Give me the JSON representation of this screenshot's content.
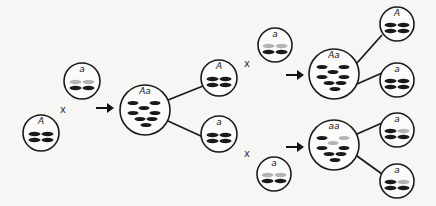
{
  "colors": {
    "dark_chromosome": "#1a1a1a",
    "light_chromosome": "#b4b4b4",
    "outline": "#1a1a1a",
    "background": "#f6f6f4"
  },
  "cells": [
    {
      "id": "parent-A-left",
      "label": "A",
      "cx": 41,
      "cy": 133,
      "r": 18,
      "type": "haploid",
      "rows": [
        [
          "dark",
          "dark"
        ],
        [
          "dark",
          "dark"
        ]
      ]
    },
    {
      "id": "parent-a-left",
      "label": "a",
      "cx": 82,
      "cy": 81,
      "r": 18,
      "type": "haploid",
      "rows": [
        [
          "light",
          "light"
        ],
        [
          "dark",
          "dark"
        ]
      ]
    },
    {
      "id": "zygote-Aa-left",
      "label": "Aa",
      "cx": 145,
      "cy": 110,
      "r": 25,
      "type": "diploid",
      "chromosomes": [
        [
          "dark",
          -12,
          -10
        ],
        [
          "dark",
          10,
          -10
        ],
        [
          "dark",
          -1,
          -5
        ],
        [
          "dark",
          -12,
          0
        ],
        [
          "dark",
          10,
          0
        ],
        [
          "dark",
          -5,
          6
        ],
        [
          "dark",
          7,
          6
        ],
        [
          "dark",
          1,
          12
        ]
      ]
    },
    {
      "id": "gamete-A-mid",
      "label": "A",
      "cx": 219,
      "cy": 78,
      "r": 18,
      "type": "haploid",
      "rows": [
        [
          "dark",
          "dark"
        ],
        [
          "dark",
          "dark"
        ]
      ]
    },
    {
      "id": "gamete-a-mid",
      "label": "a",
      "cx": 219,
      "cy": 134,
      "r": 18,
      "type": "haploid",
      "rows": [
        [
          "dark",
          "dark"
        ],
        [
          "dark",
          "dark"
        ]
      ]
    },
    {
      "id": "parent-a-upper",
      "label": "a",
      "cx": 275,
      "cy": 45,
      "r": 17,
      "type": "haploid",
      "rows": [
        [
          "light",
          "light"
        ],
        [
          "dark",
          "dark"
        ]
      ]
    },
    {
      "id": "zygote-Aa-right",
      "label": "Aa",
      "cx": 334,
      "cy": 74,
      "r": 25,
      "type": "diploid",
      "chromosomes": [
        [
          "dark",
          -12,
          -10
        ],
        [
          "dark",
          10,
          -10
        ],
        [
          "dark",
          -1,
          -5
        ],
        [
          "dark",
          -12,
          0
        ],
        [
          "dark",
          10,
          0
        ],
        [
          "dark",
          -5,
          6
        ],
        [
          "dark",
          7,
          6
        ],
        [
          "dark",
          1,
          12
        ]
      ]
    },
    {
      "id": "gamete-A-top-right",
      "label": "A",
      "cx": 397,
      "cy": 24,
      "r": 17,
      "type": "haploid",
      "rows": [
        [
          "dark",
          "dark"
        ],
        [
          "dark",
          "dark"
        ]
      ]
    },
    {
      "id": "gamete-a-upper-right",
      "label": "a",
      "cx": 397,
      "cy": 80,
      "r": 17,
      "type": "haploid",
      "rows": [
        [
          "dark",
          "dark"
        ],
        [
          "dark",
          "dark"
        ]
      ]
    },
    {
      "id": "parent-a-lower",
      "label": "a",
      "cx": 274,
      "cy": 174,
      "r": 17,
      "type": "haploid",
      "rows": [
        [
          "light",
          "light"
        ],
        [
          "dark",
          "dark"
        ]
      ]
    },
    {
      "id": "zygote-aa",
      "label": "aa",
      "cx": 334,
      "cy": 145,
      "r": 25,
      "type": "diploid",
      "chromosomes": [
        [
          "dark",
          -12,
          -10
        ],
        [
          "light",
          10,
          -10
        ],
        [
          "light",
          -1,
          -5
        ],
        [
          "dark",
          -12,
          0
        ],
        [
          "dark",
          10,
          0
        ],
        [
          "dark",
          -5,
          6
        ],
        [
          "dark",
          7,
          6
        ],
        [
          "dark",
          1,
          12
        ]
      ]
    },
    {
      "id": "gamete-a-lower-right-1",
      "label": "a",
      "cx": 397,
      "cy": 130,
      "r": 17,
      "type": "haploid",
      "rows": [
        [
          "dark",
          "light"
        ],
        [
          "dark",
          "dark"
        ]
      ]
    },
    {
      "id": "gamete-a-lower-right-2",
      "label": "a",
      "cx": 397,
      "cy": 181,
      "r": 17,
      "type": "haploid",
      "rows": [
        [
          "dark",
          "light"
        ],
        [
          "dark",
          "dark"
        ]
      ]
    }
  ],
  "connectors": [
    {
      "x1": 168,
      "y1": 100,
      "x2": 203,
      "y2": 86
    },
    {
      "x1": 168,
      "y1": 121,
      "x2": 203,
      "y2": 137
    },
    {
      "x1": 357,
      "y1": 63,
      "x2": 382,
      "y2": 35
    },
    {
      "x1": 357,
      "y1": 84,
      "x2": 382,
      "y2": 73
    },
    {
      "x1": 357,
      "y1": 134,
      "x2": 382,
      "y2": 123
    },
    {
      "x1": 357,
      "y1": 156,
      "x2": 382,
      "y2": 174
    }
  ],
  "crosses": [
    {
      "symbol": "x",
      "x": 63,
      "y": 113
    },
    {
      "symbol": "x",
      "x": 247,
      "y": 67
    },
    {
      "symbol": "x",
      "x": 247,
      "y": 157
    }
  ],
  "arrows": [
    {
      "x1": 96,
      "y1": 108,
      "x2": 114,
      "y2": 108
    },
    {
      "x1": 286,
      "y1": 75,
      "x2": 304,
      "y2": 75
    },
    {
      "x1": 286,
      "y1": 147,
      "x2": 304,
      "y2": 147
    }
  ]
}
